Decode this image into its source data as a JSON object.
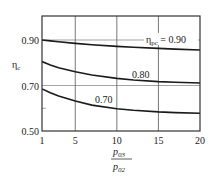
{
  "chart_data": {
    "type": "line",
    "title": "",
    "xlabel": "p03 / p02",
    "xlabel_numerator": "p",
    "xlabel_numerator_sub": "03",
    "xlabel_denominator": "p",
    "xlabel_denominator_sub": "02",
    "ylabel": "ηc",
    "ylabel_main": "η",
    "ylabel_sub": "c",
    "xlim": [
      1,
      20
    ],
    "ylim": [
      0.5,
      0.95
    ],
    "x_ticks": [
      "1",
      "5",
      "10",
      "15",
      "20"
    ],
    "y_ticks": [
      "0.50",
      "0.70",
      "0.90"
    ],
    "grid": true,
    "x": [
      1,
      2,
      3,
      5,
      7,
      10,
      12,
      15,
      17,
      20
    ],
    "series": [
      {
        "name": "ηpc = 0.90",
        "label_main": "η",
        "label_sub": "pc",
        "label_value": " = 0.90",
        "values": [
          0.9,
          0.896,
          0.892,
          0.885,
          0.879,
          0.872,
          0.868,
          0.863,
          0.86,
          0.856
        ]
      },
      {
        "name": "0.80",
        "label_value": "0.80",
        "values": [
          0.805,
          0.79,
          0.778,
          0.76,
          0.746,
          0.731,
          0.724,
          0.717,
          0.714,
          0.711
        ]
      },
      {
        "name": "0.70",
        "label_value": "0.70",
        "values": [
          0.685,
          0.668,
          0.654,
          0.632,
          0.614,
          0.598,
          0.591,
          0.584,
          0.581,
          0.578
        ]
      }
    ],
    "legend": "inline labels on curves"
  }
}
